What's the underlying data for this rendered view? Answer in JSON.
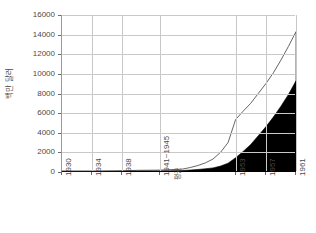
{
  "chart_data": {
    "type": "area",
    "title": "",
    "xlabel": "",
    "ylabel": "백만 달러",
    "ylim": [
      0,
      16000
    ],
    "ytick_labels": [
      "16000",
      "14000",
      "12000",
      "10000",
      "8000",
      "6000",
      "4000",
      "2000",
      "0"
    ],
    "ytick_values": [
      16000,
      14000,
      12000,
      10000,
      8000,
      6000,
      4000,
      2000,
      0
    ],
    "xtick_labels": [
      "1930",
      "1934",
      "1938",
      "1941~1945",
      "1953",
      "1957",
      "1961"
    ],
    "xtick_sublabels": [
      "",
      "",
      "",
      "평균",
      "",
      "",
      ""
    ],
    "xtick_years": [
      1930,
      1934,
      1938,
      1943,
      1953,
      1957,
      1961
    ],
    "grid": true,
    "legend": "none",
    "stacked": true,
    "x": [
      1930,
      1931,
      1932,
      1933,
      1934,
      1935,
      1936,
      1937,
      1938,
      1939,
      1940,
      1943,
      1946,
      1947,
      1948,
      1949,
      1950,
      1951,
      1952,
      1953,
      1954,
      1955,
      1956,
      1957,
      1958,
      1959,
      1960,
      1961
    ],
    "series": [
      {
        "name": "lower-band",
        "color": "#000000",
        "values": [
          60,
          60,
          60,
          60,
          60,
          60,
          70,
          70,
          80,
          90,
          100,
          110,
          150,
          200,
          260,
          330,
          420,
          600,
          900,
          1450,
          2100,
          2800,
          3700,
          4600,
          5600,
          6700,
          7900,
          9300
        ]
      },
      {
        "name": "upper-band",
        "color": "#ffffff",
        "values": [
          40,
          40,
          40,
          40,
          40,
          40,
          40,
          50,
          50,
          60,
          70,
          80,
          150,
          260,
          400,
          600,
          900,
          1400,
          2100,
          3900,
          4100,
          4200,
          4300,
          4400,
          4500,
          4700,
          4900,
          5000
        ]
      }
    ],
    "totals": [
      100,
      100,
      100,
      100,
      100,
      100,
      110,
      120,
      130,
      150,
      170,
      190,
      300,
      460,
      660,
      930,
      1320,
      2000,
      3000,
      5350,
      6200,
      7000,
      8000,
      9000,
      10100,
      11400,
      12800,
      14300
    ]
  }
}
